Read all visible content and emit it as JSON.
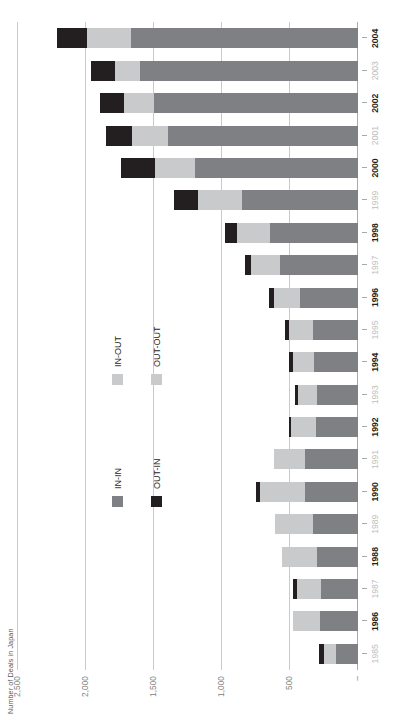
{
  "chart_data": {
    "type": "bar",
    "subtype": "stacked-horizontal",
    "title": "",
    "xlabel": "",
    "ylabel": "Number of Deals in Japan",
    "orientation": "horizontal-bars-rotated-90",
    "grid": true,
    "legend_position": "inside-left-middle",
    "ylim": [
      0,
      2500
    ],
    "yticks": [
      0,
      500,
      1000,
      1500,
      2000,
      2500
    ],
    "ytick_labels": [
      "–",
      "500",
      "1,000",
      "1,500",
      "2,000",
      "2,500"
    ],
    "categories": [
      "1985",
      "1986",
      "1987",
      "1988",
      "1989",
      "1990",
      "1991",
      "1992",
      "1993",
      "1994",
      "1995",
      "1996",
      "1997",
      "1998",
      "1999",
      "2000",
      "2001",
      "2002",
      "2003",
      "2004"
    ],
    "series": [
      {
        "name": "IN-IN",
        "color": "#7e8083",
        "values": [
          160,
          280,
          270,
          300,
          330,
          390,
          390,
          310,
          300,
          320,
          330,
          430,
          570,
          650,
          850,
          1200,
          1400,
          1500,
          1600,
          1670
        ]
      },
      {
        "name": "IN-OUT",
        "color": "#c9cacb",
        "values": [
          90,
          200,
          180,
          260,
          280,
          330,
          230,
          180,
          140,
          160,
          180,
          190,
          220,
          240,
          330,
          290,
          260,
          220,
          190,
          320
        ]
      },
      {
        "name": "OUT-IN",
        "color": "#231f20",
        "values": [
          35,
          0,
          30,
          0,
          0,
          30,
          0,
          20,
          25,
          30,
          25,
          35,
          40,
          90,
          170,
          250,
          190,
          180,
          170,
          220
        ]
      },
      {
        "name": "OUT-OUT",
        "color": "#c9cacb",
        "values": [
          0,
          0,
          0,
          0,
          0,
          0,
          0,
          0,
          0,
          0,
          0,
          0,
          0,
          0,
          0,
          0,
          0,
          0,
          0,
          0
        ]
      }
    ],
    "totals": [
      285,
      480,
      480,
      560,
      610,
      750,
      620,
      510,
      465,
      510,
      535,
      655,
      830,
      980,
      1350,
      1740,
      1850,
      1900,
      1960,
      2210
    ],
    "emphasized_categories": [
      "1986",
      "1988",
      "1990",
      "1992",
      "1994",
      "1996",
      "1998",
      "2000",
      "2002",
      "2004"
    ]
  },
  "axis": {
    "title": "Number of Deals in Japan"
  },
  "legend": {
    "items": [
      {
        "label": "IN-IN",
        "swatch": "legend-swatch-in-in"
      },
      {
        "label": "IN-OUT",
        "swatch": "legend-swatch-in-out"
      },
      {
        "label": "OUT-IN",
        "swatch": "legend-swatch-out-in"
      },
      {
        "label": "OUT-OUT",
        "swatch": "legend-swatch-out-out"
      }
    ]
  }
}
